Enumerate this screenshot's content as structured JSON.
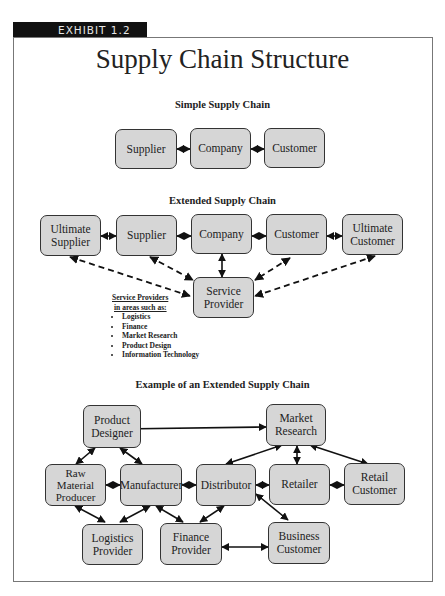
{
  "exhibit_label": "EXHIBIT 1.2",
  "title": "Supply Chain Structure",
  "simple": {
    "heading": "Simple Supply Chain",
    "nodes": [
      "Supplier",
      "Company",
      "Customer"
    ]
  },
  "extended": {
    "heading": "Extended Supply Chain",
    "nodes": {
      "ultimate_supplier": "Ultimate Supplier",
      "supplier": "Supplier",
      "company": "Company",
      "customer": "Customer",
      "ultimate_customer": "Ultimate Customer",
      "service_provider": "Service Provider"
    },
    "legend": {
      "heading_line1": "Service Providers",
      "heading_line2": "in areas such as:",
      "items": [
        "Logistics",
        "Finance",
        "Market Research",
        "Product Design",
        "Information Technology"
      ]
    }
  },
  "example": {
    "heading": "Example of an Extended Supply Chain",
    "nodes": {
      "product_designer": "Product Designer",
      "market_research": "Market Research",
      "raw_material_producer": "Raw Material Producer",
      "manufacturer": "Manufacturer",
      "distributor": "Distributor",
      "retailer": "Retailer",
      "retail_customer": "Retail Customer",
      "logistics_provider": "Logistics Provider",
      "finance_provider": "Finance Provider",
      "business_customer": "Business Customer"
    }
  },
  "colors": {
    "box_fill": "#d6d6d6",
    "box_border": "#333333",
    "tab_bg": "#111111"
  }
}
